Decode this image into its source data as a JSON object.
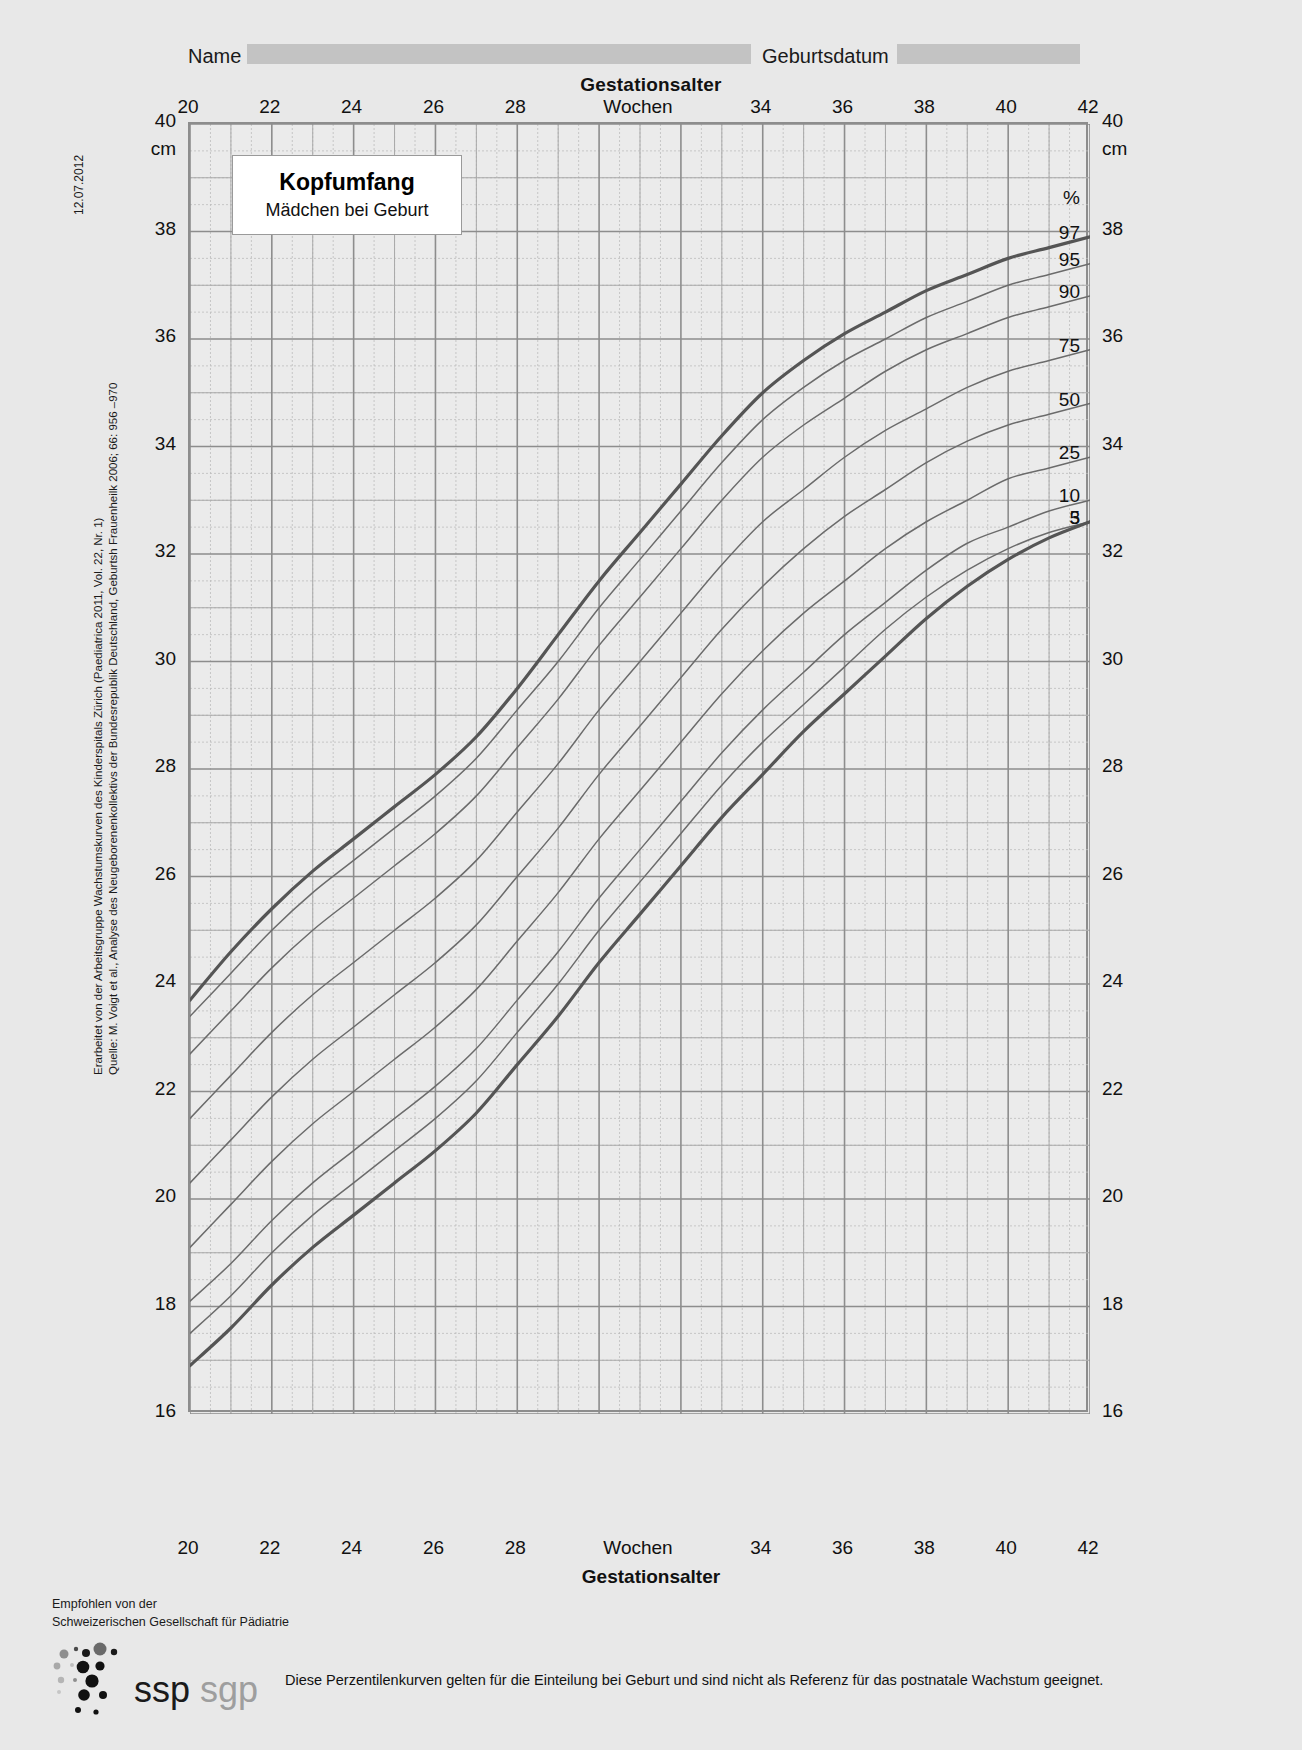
{
  "header": {
    "name_label": "Name",
    "name_value": "",
    "birthdate_label": "Geburtsdatum",
    "birthdate_value": ""
  },
  "chart_title": {
    "main": "Kopfumfang",
    "sub": "Mädchen bei Geburt"
  },
  "side_notes": {
    "date": "12.07.2012",
    "source_line1": "Erarbeitet von der Arbeitsgruppe Wachstumskurven des Kinderspitals Zürich (Paediatrica 2011, Vol. 22, Nr. 1)",
    "source_line2": "Quelle: M. Voigt et al., Analyse des Neugeborenenkollektivs der Bundesrepublik Deutschland, Geburtsh Frauenheilk 2006; 66: 956     –970"
  },
  "footer": {
    "recommended_line1": "Empfohlen von der",
    "recommended_line2": "Schweizerischen Gesellschaft für Pädiatrie",
    "logo_primary": "ssp",
    "logo_secondary": "sgp",
    "note": "Diese Perzentilenkurven gelten für die Einteilung bei Geburt und sind nicht als Referenz für das postnatale Wachstum geeignet."
  },
  "colors": {
    "page_bg": "#e8e8e8",
    "plot_bg": "#ebebeb",
    "grid_major": "#8d8d8d",
    "grid_minor": "#bdbdbd",
    "curve_outer": "#555555",
    "curve_inner": "#6b6b6b",
    "field_fill": "#c3c3c3"
  },
  "chart_data": {
    "type": "line",
    "xlabel": "Gestationsalter",
    "x_unit_label": "Wochen",
    "ylabel": "cm",
    "y_unit_label": "cm",
    "xlim": [
      20,
      42
    ],
    "ylim": [
      16,
      40
    ],
    "x_major_ticks": [
      20,
      22,
      24,
      26,
      28,
      30,
      32,
      34,
      36,
      38,
      40,
      42
    ],
    "x_tick_labels": [
      "20",
      "22",
      "24",
      "26",
      "28",
      "Wochen",
      "34",
      "36",
      "38",
      "40",
      "42"
    ],
    "x_minor_step": 0.5,
    "y_major_ticks": [
      16,
      18,
      20,
      22,
      24,
      26,
      28,
      30,
      32,
      34,
      36,
      38,
      40
    ],
    "y_minor_step": 0.5,
    "grid": true,
    "legend_position": "right-edge",
    "legend_unit": "%",
    "x": [
      20,
      21,
      22,
      23,
      24,
      25,
      26,
      27,
      28,
      29,
      30,
      31,
      32,
      33,
      34,
      35,
      36,
      37,
      38,
      39,
      40,
      41,
      42
    ],
    "series": [
      {
        "name": "97",
        "emphasis": "bold",
        "values": [
          23.7,
          24.6,
          25.4,
          26.1,
          26.7,
          27.3,
          27.9,
          28.6,
          29.5,
          30.5,
          31.5,
          32.4,
          33.3,
          34.2,
          35.0,
          35.6,
          36.1,
          36.5,
          36.9,
          37.2,
          37.5,
          37.7,
          37.9
        ]
      },
      {
        "name": "95",
        "emphasis": "normal",
        "values": [
          23.4,
          24.2,
          25.0,
          25.7,
          26.3,
          26.9,
          27.5,
          28.2,
          29.1,
          30.0,
          31.0,
          31.9,
          32.8,
          33.7,
          34.5,
          35.1,
          35.6,
          36.0,
          36.4,
          36.7,
          37.0,
          37.2,
          37.4
        ]
      },
      {
        "name": "90",
        "emphasis": "normal",
        "values": [
          22.7,
          23.5,
          24.3,
          25.0,
          25.6,
          26.2,
          26.8,
          27.5,
          28.4,
          29.3,
          30.3,
          31.2,
          32.1,
          33.0,
          33.8,
          34.4,
          34.9,
          35.4,
          35.8,
          36.1,
          36.4,
          36.6,
          36.8
        ]
      },
      {
        "name": "75",
        "emphasis": "normal",
        "values": [
          21.5,
          22.3,
          23.1,
          23.8,
          24.4,
          25.0,
          25.6,
          26.3,
          27.2,
          28.1,
          29.1,
          30.0,
          30.9,
          31.8,
          32.6,
          33.2,
          33.8,
          34.3,
          34.7,
          35.1,
          35.4,
          35.6,
          35.8
        ]
      },
      {
        "name": "50",
        "emphasis": "normal",
        "values": [
          20.3,
          21.1,
          21.9,
          22.6,
          23.2,
          23.8,
          24.4,
          25.1,
          26.0,
          26.9,
          27.9,
          28.8,
          29.7,
          30.6,
          31.4,
          32.1,
          32.7,
          33.2,
          33.7,
          34.1,
          34.4,
          34.6,
          34.8
        ]
      },
      {
        "name": "25",
        "emphasis": "normal",
        "values": [
          19.1,
          19.9,
          20.7,
          21.4,
          22.0,
          22.6,
          23.2,
          23.9,
          24.8,
          25.7,
          26.7,
          27.6,
          28.5,
          29.4,
          30.2,
          30.9,
          31.5,
          32.1,
          32.6,
          33.0,
          33.4,
          33.6,
          33.8
        ]
      },
      {
        "name": "10",
        "emphasis": "normal",
        "values": [
          18.1,
          18.8,
          19.6,
          20.3,
          20.9,
          21.5,
          22.1,
          22.8,
          23.7,
          24.6,
          25.6,
          26.5,
          27.4,
          28.3,
          29.1,
          29.8,
          30.5,
          31.1,
          31.7,
          32.2,
          32.5,
          32.8,
          33.0
        ]
      },
      {
        "name": "5",
        "emphasis": "normal",
        "values": [
          17.5,
          18.2,
          19.0,
          19.7,
          20.3,
          20.9,
          21.5,
          22.2,
          23.1,
          24.0,
          25.0,
          25.9,
          26.8,
          27.7,
          28.5,
          29.2,
          29.9,
          30.6,
          31.2,
          31.7,
          32.1,
          32.4,
          32.6
        ]
      },
      {
        "name": "3",
        "emphasis": "bold",
        "values": [
          16.9,
          17.6,
          18.4,
          19.1,
          19.7,
          20.3,
          20.9,
          21.6,
          22.5,
          23.4,
          24.4,
          25.3,
          26.2,
          27.1,
          27.9,
          28.7,
          29.4,
          30.1,
          30.8,
          31.4,
          31.9,
          32.3,
          32.6
        ]
      }
    ],
    "percentile_labels": [
      "%",
      "97",
      "95",
      "90",
      "75",
      "50",
      "25",
      "10",
      "5",
      "3"
    ]
  }
}
